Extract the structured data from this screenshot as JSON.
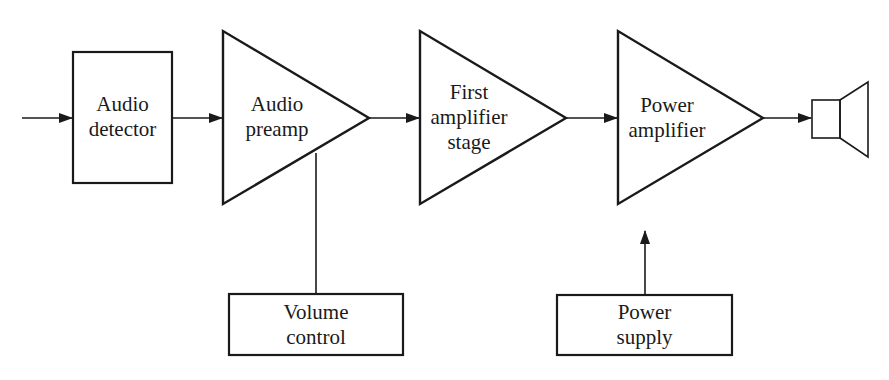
{
  "diagram": {
    "blocks": [
      {
        "id": "audio-detector",
        "shape": "rectangle",
        "lines": [
          "Audio",
          "detector"
        ]
      },
      {
        "id": "audio-preamp",
        "shape": "triangle",
        "lines": [
          "Audio",
          "preamp"
        ]
      },
      {
        "id": "first-amplifier-stage",
        "shape": "triangle",
        "lines": [
          "First",
          "amplifier",
          "stage"
        ]
      },
      {
        "id": "power-amplifier",
        "shape": "triangle",
        "lines": [
          "Power",
          "amplifier"
        ]
      },
      {
        "id": "speaker",
        "shape": "speaker-icon",
        "lines": []
      },
      {
        "id": "volume-control",
        "shape": "rectangle",
        "lines": [
          "Volume",
          "control"
        ]
      },
      {
        "id": "power-supply",
        "shape": "rectangle",
        "lines": [
          "Power",
          "supply"
        ]
      }
    ],
    "connections": [
      {
        "from": "input",
        "to": "audio-detector",
        "arrow": true
      },
      {
        "from": "audio-detector",
        "to": "audio-preamp",
        "arrow": true
      },
      {
        "from": "audio-preamp",
        "to": "first-amplifier-stage",
        "arrow": true
      },
      {
        "from": "first-amplifier-stage",
        "to": "power-amplifier",
        "arrow": true
      },
      {
        "from": "power-amplifier",
        "to": "speaker",
        "arrow": true
      },
      {
        "from": "volume-control",
        "to": "audio-preamp",
        "arrow": false
      },
      {
        "from": "power-supply",
        "to": "power-amplifier",
        "arrow": true
      }
    ],
    "colors": {
      "stroke": "#1a1a1a",
      "background": "#ffffff"
    }
  }
}
